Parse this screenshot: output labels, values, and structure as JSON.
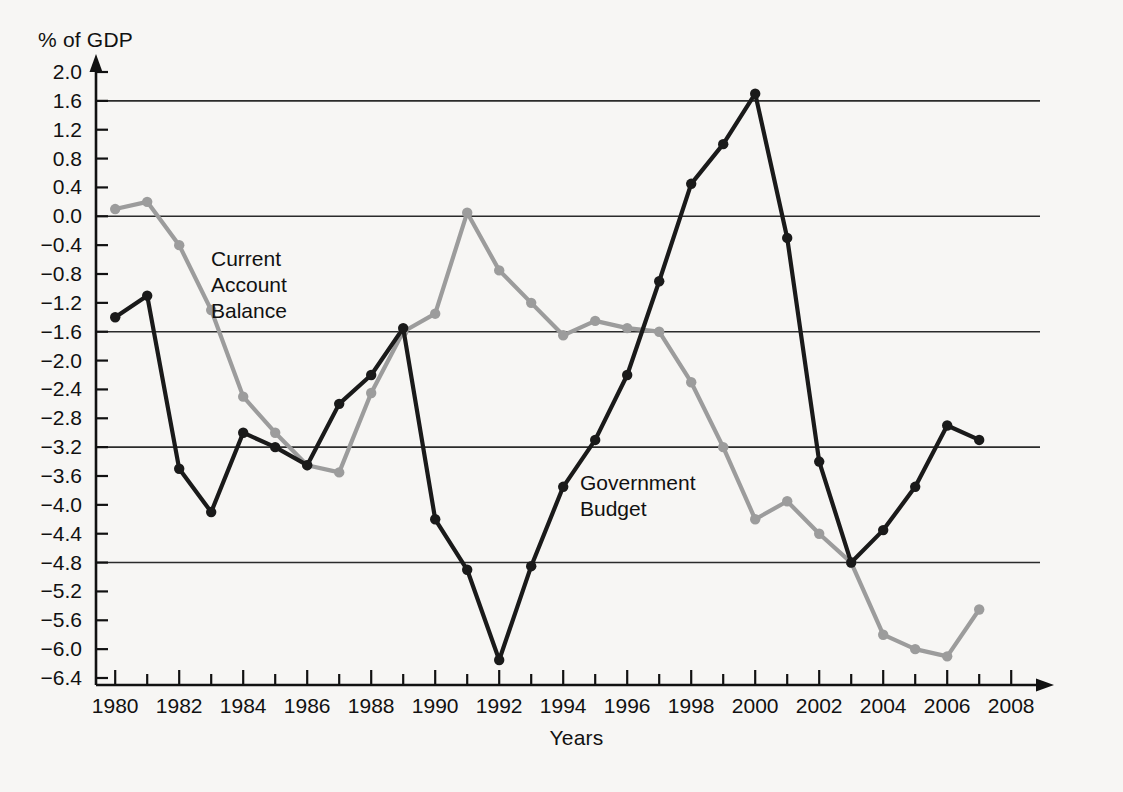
{
  "chart_data": {
    "type": "line",
    "title": "",
    "xlabel": "Years",
    "ylabel": "% of GDP",
    "xlim": [
      1979.4,
      2008.9
    ],
    "ylim": [
      -6.4,
      2.0
    ],
    "grid": "horizontal-major",
    "gridlines": [
      1.6,
      0.0,
      -1.6,
      -3.2,
      -4.8
    ],
    "legend_position": "inline-annotation",
    "x_tick_step": 1,
    "x_label_step": 2,
    "y_tick_step": 0.4,
    "x_tick_labels": [
      "1980",
      "1982",
      "1984",
      "1986",
      "1988",
      "1990",
      "1992",
      "1994",
      "1996",
      "1998",
      "2000",
      "2002",
      "2004",
      "2006",
      "2008"
    ],
    "y_tick_labels": [
      "2.0",
      "1.6",
      "1.2",
      "0.8",
      "0.4",
      "0.0",
      "−0.4",
      "−0.8",
      "−1.2",
      "−1.6",
      "−2.0",
      "−2.4",
      "−2.8",
      "−3.2",
      "−3.6",
      "−4.0",
      "−4.4",
      "−4.8",
      "−5.2",
      "−5.6",
      "−6.0",
      "−6.4"
    ],
    "y_tick_values": [
      2.0,
      1.6,
      1.2,
      0.8,
      0.4,
      0.0,
      -0.4,
      -0.8,
      -1.2,
      -1.6,
      -2.0,
      -2.4,
      -2.8,
      -3.2,
      -3.6,
      -4.0,
      -4.4,
      -4.8,
      -5.2,
      -5.6,
      -6.0,
      -6.4
    ],
    "x": [
      1980,
      1981,
      1982,
      1983,
      1984,
      1985,
      1986,
      1987,
      1988,
      1989,
      1990,
      1991,
      1992,
      1993,
      1994,
      1995,
      1996,
      1997,
      1998,
      1999,
      2000,
      2001,
      2002,
      2003,
      2004,
      2005,
      2006,
      2007
    ],
    "series": [
      {
        "name": "Government Budget",
        "color": "#1a1a1a",
        "marker": "circle",
        "values": [
          -1.4,
          -1.1,
          -3.5,
          -4.1,
          -3.0,
          -3.2,
          -3.45,
          -2.6,
          -2.2,
          -1.55,
          -4.2,
          -4.9,
          -6.15,
          -4.85,
          -3.75,
          -3.1,
          -2.2,
          -0.9,
          0.45,
          1.0,
          1.7,
          -0.3,
          -3.4,
          -4.8,
          -4.35,
          -3.75,
          -2.9,
          -3.1
        ]
      },
      {
        "name": "Current Account Balance",
        "color": "#9c9c9c",
        "marker": "circle",
        "values": [
          0.1,
          0.2,
          -0.4,
          -1.3,
          -2.5,
          -3.0,
          -3.45,
          -3.55,
          -2.45,
          -1.6,
          -1.35,
          0.05,
          -0.75,
          -1.2,
          -1.65,
          -1.45,
          -1.55,
          -1.6,
          -2.3,
          -3.2,
          -4.2,
          -3.95,
          -4.4,
          -4.8,
          -5.8,
          -6.0,
          -6.1,
          -5.45
        ]
      }
    ],
    "annotations": [
      {
        "name": "current-account-balance",
        "text": "Current\nAccount\nBalance",
        "series": "Current Account Balance"
      },
      {
        "name": "government-budget",
        "text": "Government\nBudget",
        "series": "Government Budget"
      }
    ]
  },
  "labels": {
    "y_axis_title": "% of GDP",
    "x_axis_title": "Years",
    "annotation_current_account": "Current\nAccount\nBalance",
    "annotation_government_budget": "Government\nBudget"
  },
  "colors": {
    "background": "#f7f6f4",
    "axis": "#111111",
    "grid": "#2b2b2b",
    "government_budget": "#1a1a1a",
    "current_account_balance": "#9c9c9c"
  }
}
